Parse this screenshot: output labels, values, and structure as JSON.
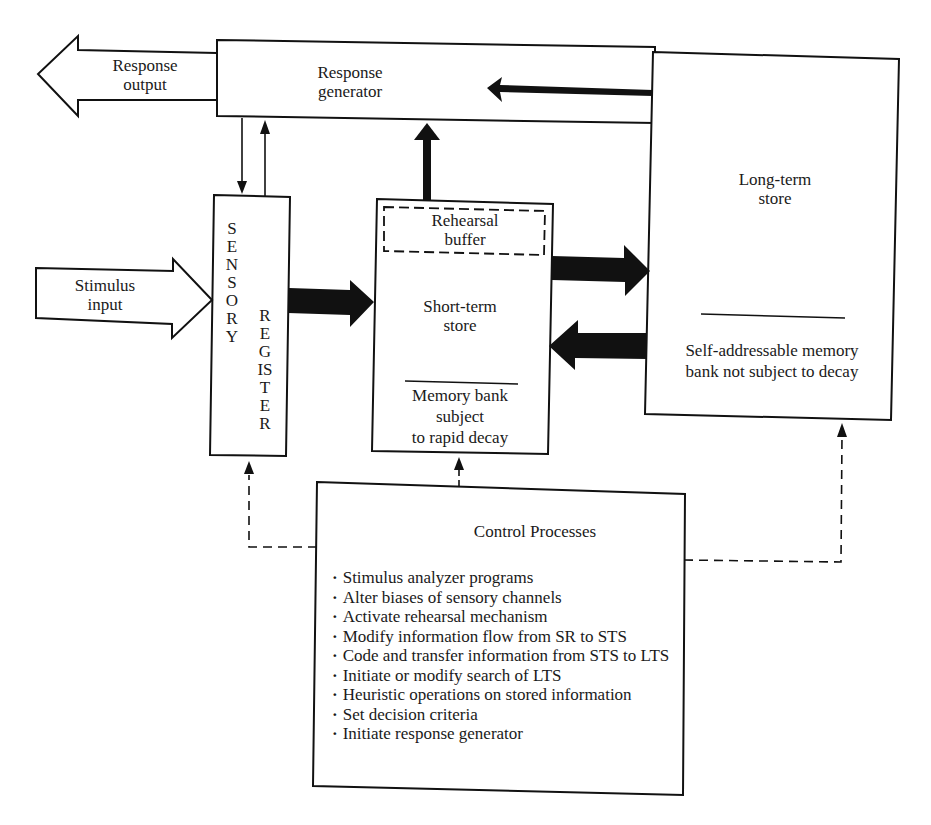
{
  "diagram": {
    "type": "flowchart",
    "nodes": {
      "response_output": {
        "label_line1": "Response",
        "label_line2": "output"
      },
      "response_generator": {
        "label_line1": "Response",
        "label_line2": "generator"
      },
      "stimulus_input": {
        "label_line1": "Stimulus",
        "label_line2": "input"
      },
      "sensory_register": {
        "label_word1": "SENSORY",
        "label_word2": "REGISTER"
      },
      "rehearsal_buffer": {
        "label_line1": "Rehearsal",
        "label_line2": "buffer"
      },
      "short_term_store": {
        "label_line1": "Short-term",
        "label_line2": "store",
        "note_line1": "Memory bank",
        "note_line2": "subject",
        "note_line3": "to rapid decay"
      },
      "long_term_store": {
        "label_line1": "Long-term",
        "label_line2": "store",
        "note_line1": "Self-addressable memory",
        "note_line2": "bank not subject to decay"
      },
      "control_processes": {
        "title": "Control Processes",
        "items": [
          "Stimulus analyzer programs",
          "Alter biases of sensory channels",
          "Activate rehearsal mechanism",
          "Modify information flow from SR to STS",
          "Code and transfer information from STS to LTS",
          "Initiate or modify search of LTS",
          "Heuristic operations on stored information",
          "Set decision criteria",
          "Initiate response generator"
        ]
      }
    },
    "edges": [
      {
        "from": "response_generator",
        "to": "response_output",
        "style": "hollow-arrow"
      },
      {
        "from": "stimulus_input",
        "to": "sensory_register",
        "style": "hollow-arrow"
      },
      {
        "from": "response_generator",
        "to": "sensory_register",
        "style": "thin"
      },
      {
        "from": "sensory_register",
        "to": "response_generator",
        "style": "thin"
      },
      {
        "from": "sensory_register",
        "to": "short_term_store",
        "style": "bold"
      },
      {
        "from": "short_term_store",
        "to": "response_generator",
        "style": "bold"
      },
      {
        "from": "long_term_store",
        "to": "response_generator",
        "style": "bold"
      },
      {
        "from": "short_term_store",
        "to": "long_term_store",
        "style": "bold"
      },
      {
        "from": "long_term_store",
        "to": "short_term_store",
        "style": "bold"
      },
      {
        "from": "control_processes",
        "to": "sensory_register",
        "style": "dashed"
      },
      {
        "from": "control_processes",
        "to": "short_term_store",
        "style": "dashed"
      },
      {
        "from": "control_processes",
        "to": "long_term_store",
        "style": "dashed"
      }
    ],
    "colors": {
      "ink": "#111111",
      "background": "#ffffff"
    }
  }
}
